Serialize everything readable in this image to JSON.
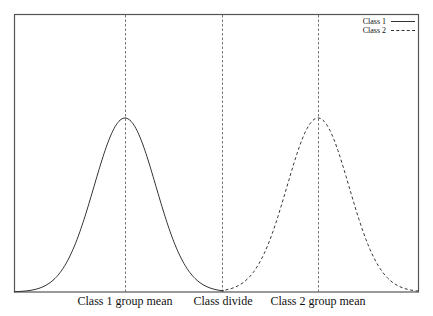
{
  "chart_data": {
    "type": "line",
    "title": "",
    "xlabel": "",
    "ylabel": "",
    "grid": false,
    "legend_position": "upper right",
    "x_tick_labels": [
      "Class 1 group mean",
      "Class divide",
      "Class 2 group mean"
    ],
    "x_ticks_px": [
      125,
      222,
      318
    ],
    "vertical_lines": [
      {
        "label": "Class 1 group mean",
        "x_px": 125,
        "style": "dashed"
      },
      {
        "label": "Class divide",
        "x_px": 222,
        "style": "dashed"
      },
      {
        "label": "Class 2 group mean",
        "x_px": 318,
        "style": "dashed"
      }
    ],
    "series": [
      {
        "name": "Class 1",
        "style": "solid",
        "distribution": "normal",
        "mean_px": 125,
        "sigma_px": 31,
        "peak_px_y": 118
      },
      {
        "name": "Class 2",
        "style": "dashed",
        "distribution": "normal",
        "mean_px": 318,
        "sigma_px": 31,
        "peak_px_y": 118
      }
    ],
    "plot_area_px": {
      "left": 14,
      "top": 15,
      "right": 418,
      "bottom": 292
    }
  },
  "legend": {
    "items": [
      {
        "label": "Class 1",
        "style": "solid"
      },
      {
        "label": "Class 2",
        "style": "dashed"
      }
    ]
  },
  "colors": {
    "frame": "#555555",
    "curve": "#333333",
    "guide": "#666666"
  }
}
